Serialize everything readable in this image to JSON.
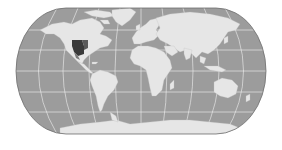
{
  "map": {
    "type": "world-map",
    "projection": "pseudocylindrical (Eckert IV–like)",
    "graticule_interval_deg": 30,
    "colors": {
      "background": "#ffffff",
      "ocean": "#9c9c9c",
      "land": "#e6e6e6",
      "graticule": "#f2f2f2",
      "outline": "#6e6e6e",
      "highlight": "#3a3a3a",
      "highlight_secondary": "#7a7a7a"
    },
    "highlighted_regions": [
      {
        "name": "central-southern United States",
        "shade": "dark"
      }
    ],
    "continents": [
      "North America",
      "South America",
      "Europe",
      "Africa",
      "Asia",
      "Australia",
      "Antarctica",
      "Greenland"
    ]
  }
}
